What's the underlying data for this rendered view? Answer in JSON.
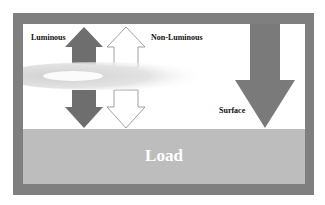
{
  "diagram": {
    "labels": {
      "luminous": "Luminous",
      "non_luminous": "Non-Luminous",
      "surface": "Surface",
      "load": "Load"
    },
    "colors": {
      "frame": "#7f7f7f",
      "load": "#bdbdbd",
      "luminous_arrow": "#6e6e6e",
      "surface_arrow": "#7a7a7a",
      "non_luminous_arrow": "#ffffff"
    }
  }
}
